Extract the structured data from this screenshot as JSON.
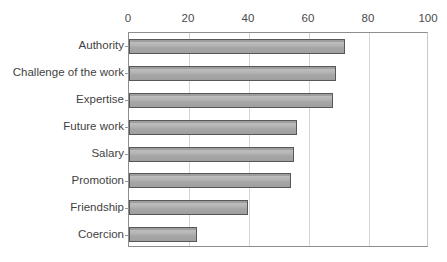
{
  "chart_data": {
    "type": "bar",
    "orientation": "horizontal",
    "title": "",
    "subtitle": "",
    "xlabel": "",
    "ylabel": "",
    "categories": [
      "Authority",
      "Challenge of the work",
      "Expertise",
      "Future work",
      "Salary",
      "Promotion",
      "Friendship",
      "Coercion"
    ],
    "values": [
      72,
      69,
      68,
      56,
      55,
      54,
      39.5,
      22.5
    ],
    "xlim": [
      0,
      100
    ],
    "xticks": [
      0,
      20,
      40,
      60,
      80,
      100
    ],
    "xtick_labels": [
      "0",
      "20",
      "40",
      "60",
      "80",
      "100"
    ],
    "grid": "vertical",
    "legend": "none",
    "series": [
      {
        "name": "",
        "values": [
          72,
          69,
          68,
          56,
          55,
          54,
          39.5,
          22.5
        ]
      }
    ],
    "colors": {
      "bar_fill": "#b0b0b0",
      "bar_border": "#575757",
      "gridline": "#d5d5d5",
      "axis": "#8d8d8d",
      "text": "#3f3f3f"
    }
  }
}
